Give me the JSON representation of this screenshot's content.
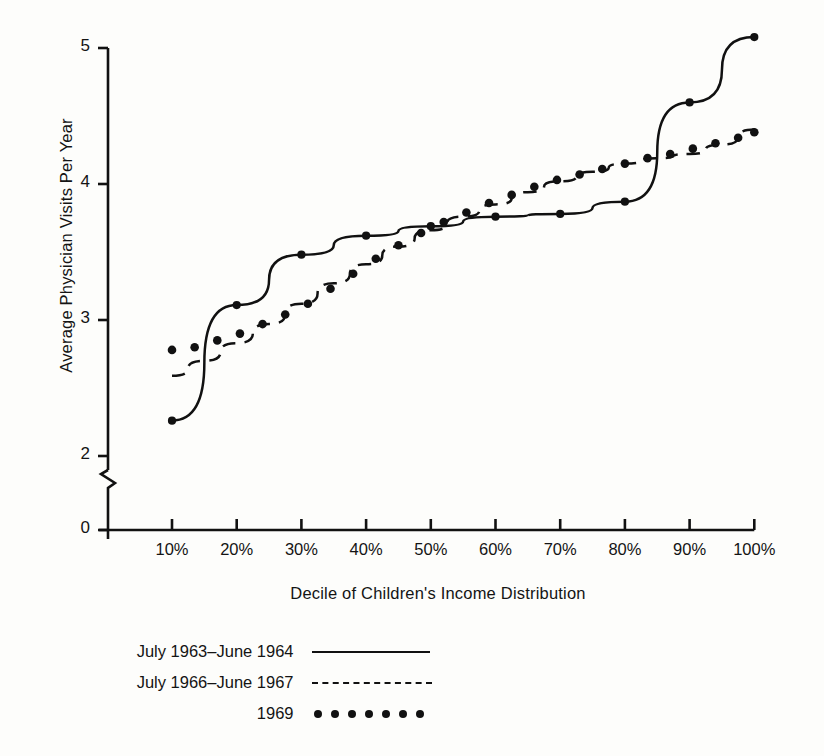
{
  "chart_data": {
    "type": "line",
    "title": "",
    "xlabel": "Decile of Children's Income Distribution",
    "ylabel": "Average Physician Visits Per Year",
    "xtick_labels": [
      "10%",
      "20%",
      "30%",
      "40%",
      "50%",
      "60%",
      "70%",
      "80%",
      "90%",
      "100%"
    ],
    "ytick_labels": [
      "0",
      "2",
      "3",
      "4",
      "5"
    ],
    "x": [
      10,
      20,
      30,
      40,
      50,
      60,
      70,
      80,
      90,
      100
    ],
    "xlim": [
      10,
      100
    ],
    "ylim": [
      2,
      5
    ],
    "y_axis_break": true,
    "y_axis_break_note": "axis broken between 0 and 2",
    "grid": false,
    "legend_position": "below-plot",
    "series": [
      {
        "name": "July 1963–June 1964",
        "style": "solid",
        "marker": "dot",
        "x": [
          10,
          20,
          30,
          40,
          50,
          60,
          70,
          80,
          90,
          100
        ],
        "values": [
          2.26,
          3.11,
          3.48,
          3.62,
          3.69,
          3.76,
          3.78,
          3.87,
          4.6,
          5.08
        ]
      },
      {
        "name": "July 1966–June 1967",
        "style": "dashed",
        "marker": "none",
        "x": [
          10,
          15,
          20,
          25,
          30,
          35,
          40,
          45,
          50,
          55,
          60,
          65,
          70,
          75,
          80,
          85,
          90,
          95,
          100
        ],
        "values": [
          2.59,
          2.7,
          2.83,
          2.97,
          3.12,
          3.27,
          3.41,
          3.54,
          3.66,
          3.76,
          3.85,
          3.94,
          4.02,
          4.09,
          4.15,
          4.19,
          4.22,
          4.29,
          4.4
        ]
      },
      {
        "name": "1969",
        "style": "dotted",
        "marker": "dot",
        "x": [
          10,
          13.5,
          17,
          20.5,
          24,
          27.5,
          31,
          34.5,
          38,
          41.5,
          45,
          48.5,
          52,
          55.5,
          59,
          62.5,
          66,
          69.5,
          73,
          76.5,
          80,
          83.5,
          87,
          90.5,
          94,
          97.5,
          100
        ],
        "values": [
          2.78,
          2.8,
          2.85,
          2.9,
          2.97,
          3.04,
          3.12,
          3.23,
          3.34,
          3.45,
          3.55,
          3.64,
          3.72,
          3.79,
          3.86,
          3.92,
          3.98,
          4.03,
          4.07,
          4.11,
          4.15,
          4.19,
          4.22,
          4.26,
          4.3,
          4.34,
          4.38
        ]
      }
    ]
  },
  "legend": {
    "rows": [
      {
        "label": "July 1963–June 1964",
        "key": "solid-line-key"
      },
      {
        "label": "July 1966–June 1967",
        "key": "dashed-line-key"
      },
      {
        "label": "1969",
        "key": "dotted-line-key"
      }
    ]
  },
  "colors": {
    "ink": "#111111",
    "paper": "#fdfdfb"
  }
}
